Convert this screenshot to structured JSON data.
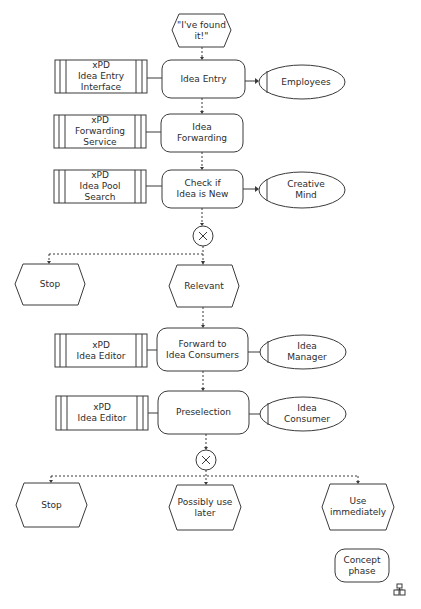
{
  "diagram": {
    "type": "EPC process chain",
    "colors": {
      "stroke": "#3a3a3a",
      "text": "#2c2c2c",
      "background": "#ffffff"
    },
    "start_event": {
      "label": "\"I've found\nit!\""
    },
    "rows": [
      {
        "system": {
          "label": "xPD\nIdea Entry\nInterface"
        },
        "function": {
          "label": "Idea Entry"
        },
        "role": {
          "label": "Employees"
        }
      },
      {
        "system": {
          "label": "xPD\nForwarding\nService"
        },
        "function": {
          "label": "Idea\nForwarding"
        }
      },
      {
        "system": {
          "label": "xPD\nIdea Pool\nSearch"
        },
        "function": {
          "label": "Check if\nIdea is New"
        },
        "role": {
          "label": "Creative\nMind"
        }
      }
    ],
    "xor1": {
      "symbol": "×",
      "branches": [
        {
          "label": "Stop"
        },
        {
          "label": "Relevant"
        }
      ]
    },
    "rows2": [
      {
        "system": {
          "label": "xPD\nIdea Editor"
        },
        "function": {
          "label": "Forward to\nIdea Consumers"
        },
        "role": {
          "label": "Idea\nManager"
        }
      },
      {
        "system": {
          "label": "xPD\nIdea Editor"
        },
        "function": {
          "label": "Preselection"
        },
        "role": {
          "label": "Idea\nConsumer"
        }
      }
    ],
    "xor2": {
      "symbol": "×",
      "branches": [
        {
          "label": "Stop"
        },
        {
          "label": "Possibly use\nlater"
        },
        {
          "label": "Use\nimmediately"
        }
      ]
    },
    "process_interface": {
      "label": "Concept\nphase",
      "icon": "hierarchy-icon"
    }
  }
}
